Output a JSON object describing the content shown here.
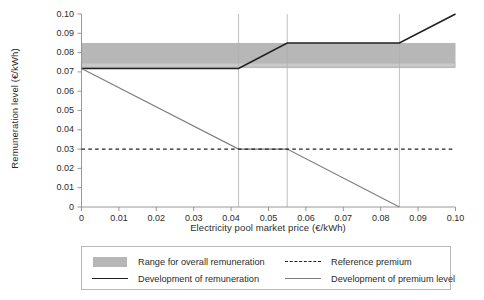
{
  "chart_data": {
    "type": "line",
    "title": "",
    "xlabel": "Electricity pool market price (€/kWh)",
    "ylabel": "Remuneration level (€/kWh)",
    "xlim": [
      0,
      0.1
    ],
    "ylim": [
      0,
      0.1
    ],
    "grid": false,
    "vertical_gridlines": [
      0.042,
      0.055,
      0.085
    ],
    "xticks": [
      0,
      0.01,
      0.02,
      0.03,
      0.04,
      0.05,
      0.06,
      0.07,
      0.08,
      0.09,
      0.1
    ],
    "xtick_labels": [
      "0",
      "0.01",
      "0.02",
      "0.03",
      "0.04",
      "0.05",
      "0.06",
      "0.07",
      "0.08",
      "0.09",
      "0.10"
    ],
    "yticks": [
      0,
      0.01,
      0.02,
      0.03,
      0.04,
      0.05,
      0.06,
      0.07,
      0.08,
      0.09,
      0.1
    ],
    "ytick_labels": [
      "0",
      "0.01",
      "0.02",
      "0.03",
      "0.04",
      "0.05",
      "0.06",
      "0.07",
      "0.08",
      "0.09",
      "0.10"
    ],
    "bands": [
      {
        "name": "Range for overall remuneration",
        "y_low": 0.072,
        "y_high": 0.085,
        "x_start": 0,
        "x_end": 0.1,
        "color": "#b7b7b7"
      }
    ],
    "series": [
      {
        "name": "Development of remuneration",
        "style": "solid",
        "color": "#231f20",
        "width": 1.6,
        "points": [
          [
            0,
            0.0718
          ],
          [
            0.042,
            0.0718
          ],
          [
            0.055,
            0.085
          ],
          [
            0.085,
            0.085
          ],
          [
            0.1,
            0.1
          ]
        ]
      },
      {
        "name": "Development of premium level",
        "style": "solid",
        "color": "#7d7d7d",
        "width": 1.1,
        "points": [
          [
            0,
            0.0718
          ],
          [
            0.042,
            0.03
          ],
          [
            0.055,
            0.03
          ],
          [
            0.085,
            0.0
          ]
        ]
      },
      {
        "name": "Reference premium",
        "style": "dashed",
        "color": "#231f20",
        "width": 1.2,
        "points": [
          [
            0,
            0.03
          ],
          [
            0.1,
            0.03
          ]
        ]
      }
    ],
    "legend": {
      "position": "below",
      "entries": [
        {
          "label": "Range for overall remuneration",
          "key": "swatch",
          "color": "#b7b7b7"
        },
        {
          "label": "Reference premium",
          "key": "dashed-line",
          "color": "#231f20"
        },
        {
          "label": "Development of remuneration",
          "key": "solid-line",
          "color": "#231f20"
        },
        {
          "label": "Development of premium level",
          "key": "solid-line",
          "color": "#7d7d7d"
        }
      ]
    }
  },
  "axes": {
    "y_title": "Remuneration level (€/kWh)",
    "x_title": "Electricity pool market price (€/kWh)",
    "y_labels": [
      "0.10",
      "0.09",
      "0.08",
      "0.07",
      "0.06",
      "0.05",
      "0.04",
      "0.03",
      "0.02",
      "0.01",
      "0"
    ],
    "x_labels": [
      "0",
      "0.01",
      "0.02",
      "0.03",
      "0.04",
      "0.05",
      "0.06",
      "0.07",
      "0.08",
      "0.09",
      "0.10"
    ]
  },
  "legend": {
    "entry_0": "Range for overall remuneration",
    "entry_1": "Reference premium",
    "entry_2": "Development of remuneration",
    "entry_3": "Development of premium level"
  },
  "colors": {
    "band": "#b7b7b7",
    "remuneration_line": "#231f20",
    "premium_line": "#7d7d7d",
    "reference_line": "#231f20",
    "axis": "#8c8c8c",
    "gridline": "#b0b0b0",
    "legend_border": "#b9b9b9"
  }
}
